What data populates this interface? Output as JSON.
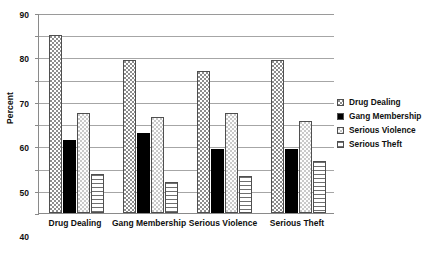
{
  "chart_data": {
    "type": "bar",
    "title": "",
    "subtitle": "",
    "xlabel": "",
    "ylabel": "Percent",
    "ylim": [
      0,
      90
    ],
    "ytick_step": 10,
    "yticks": [
      0,
      10,
      20,
      30,
      40,
      50,
      60,
      70,
      80,
      90
    ],
    "grid": true,
    "legend_position": "right",
    "categories": [
      "Drug Dealing",
      "Gang Membership",
      "Serious Violence",
      "Serious Theft"
    ],
    "series": [
      {
        "name": "Drug Dealing",
        "pattern": "dots",
        "values": [
          80,
          69,
          64,
          69
        ]
      },
      {
        "name": "Gang Membership",
        "pattern": "solid-black",
        "values": [
          33,
          36,
          29,
          29
        ]
      },
      {
        "name": "Serious Violence",
        "pattern": "light-dots",
        "values": [
          45,
          43,
          45,
          41.5
        ]
      },
      {
        "name": "Serious Theft",
        "pattern": "horizontal-lines",
        "values": [
          17.5,
          14,
          16.5,
          23.5
        ]
      }
    ]
  },
  "legend": {
    "items": [
      {
        "label": "Drug Dealing",
        "pattern": "dots"
      },
      {
        "label": "Gang Membership",
        "pattern": "solid-black"
      },
      {
        "label": "Serious Violence",
        "pattern": "light-dots"
      },
      {
        "label": "Serious Theft",
        "pattern": "horizontal-lines"
      }
    ]
  },
  "colors": {
    "axis": "#8a8a8a",
    "gridline": "#a6a6a6",
    "bar_outline": "#4f4f4f",
    "text": "#101010",
    "background": "#ffffff"
  }
}
